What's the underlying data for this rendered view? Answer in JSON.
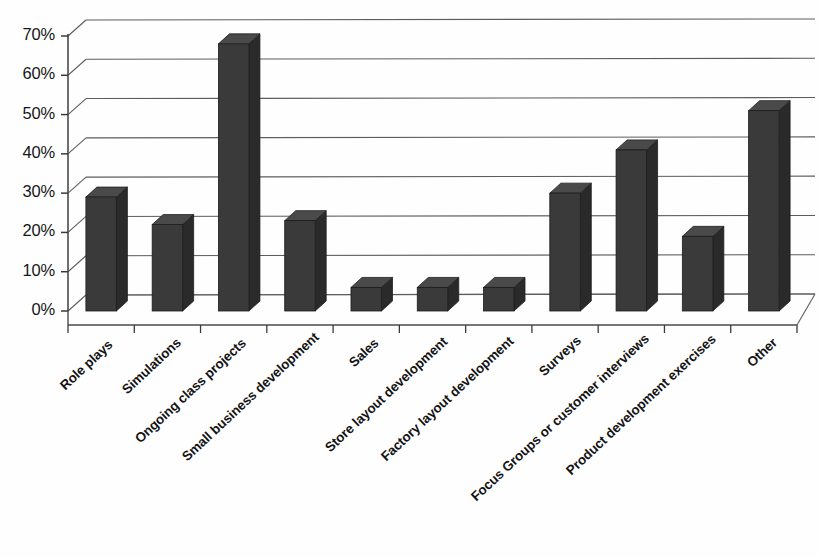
{
  "chart_data": {
    "type": "bar",
    "title": "",
    "subtitle": "",
    "xlabel": "",
    "ylabel": "",
    "ylim": [
      0,
      70
    ],
    "ytick_labels": [
      "0%",
      "10%",
      "20%",
      "30%",
      "40%",
      "50%",
      "60%",
      "70%"
    ],
    "ytick_values": [
      0,
      10,
      20,
      30,
      40,
      50,
      60,
      70
    ],
    "grid": true,
    "legend": "none",
    "style": "3d-column",
    "bar_color": "#3a3a3a",
    "bar_side_color": "#2a2a2a",
    "bar_top_color": "#4a4a4a",
    "gridline_color": "#5d5d5d",
    "background_color": "#ffffff",
    "categories": [
      "Role plays",
      "Simulations",
      "Ongoing class projects",
      "Small business development",
      "Sales",
      "Store layout development",
      "Factory layout development",
      "Surveys",
      "Focus Groups or customer interviews",
      "Product development exercises",
      "Other"
    ],
    "values": [
      29,
      22,
      68,
      23,
      6,
      6,
      6,
      30,
      41,
      19,
      51
    ],
    "value_labels": [
      "29%",
      "22%",
      "68%",
      "23%",
      "6%",
      "6%",
      "6%",
      "30%",
      "41%",
      "19%",
      "51%"
    ]
  }
}
